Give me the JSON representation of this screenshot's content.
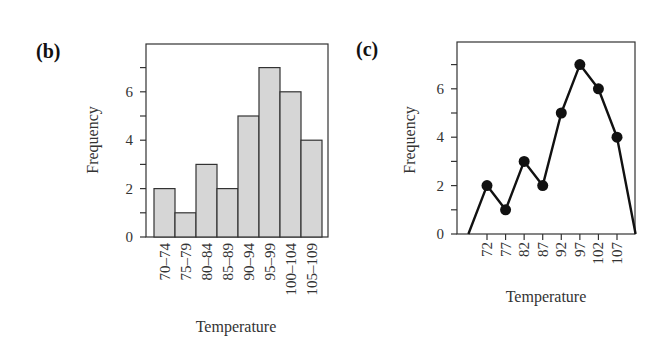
{
  "chart_data": [
    {
      "panel": "(b)",
      "type": "bar",
      "title": "",
      "xlabel": "Temperature",
      "ylabel": "Frequency",
      "categories": [
        "70–74",
        "75–79",
        "80–84",
        "85–89",
        "90–94",
        "95–99",
        "100–104",
        "105–109"
      ],
      "values": [
        2,
        1,
        3,
        2,
        5,
        7,
        6,
        4
      ],
      "ylim": [
        0,
        8
      ],
      "yticks_labeled": [
        0,
        2,
        4,
        6
      ],
      "yticks_minor": [
        1,
        3,
        5,
        7
      ],
      "grid": false,
      "bar_color": "#d6d6d6",
      "edge_color": "#333333"
    },
    {
      "panel": "(c)",
      "type": "line",
      "title": "",
      "xlabel": "Temperature",
      "ylabel": "Frequency",
      "x": [
        67,
        72,
        77,
        82,
        87,
        92,
        97,
        102,
        107,
        112
      ],
      "values": [
        0,
        2,
        1,
        3,
        2,
        5,
        7,
        6,
        4,
        0
      ],
      "markers_x": [
        72,
        77,
        82,
        87,
        92,
        97,
        102,
        107
      ],
      "xtick_labels": [
        "72",
        "77",
        "82",
        "87",
        "92",
        "97",
        "102",
        "107"
      ],
      "ylim": [
        0,
        8
      ],
      "yticks_labeled": [
        0,
        2,
        4,
        6
      ],
      "yticks_minor": [
        1,
        3,
        5,
        7
      ],
      "grid": false,
      "line_color": "#111111"
    }
  ],
  "panels": {
    "b": {
      "label": "(b)",
      "xlabel": "Temperature",
      "ylabel": "Frequency"
    },
    "c": {
      "label": "(c)",
      "xlabel": "Temperature",
      "ylabel": "Frequency"
    }
  }
}
